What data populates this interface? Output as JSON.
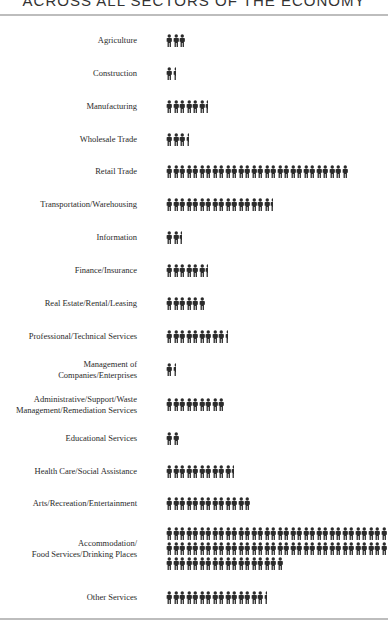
{
  "title": "ACROSS ALL SECTORS OF THE ECONOMY",
  "icon": "person-icon",
  "icon_color": "#2b2b2b",
  "chart_data": {
    "type": "pictograph",
    "title": "ACROSS ALL SECTORS OF THE ECONOMY",
    "unit": "person icons (relative employment)",
    "categories": [
      "Agriculture",
      "Construction",
      "Manufacturing",
      "Wholesale Trade",
      "Retail Trade",
      "Transportation/Warehousing",
      "Information",
      "Finance/Insurance",
      "Real Estate/Rental/Leasing",
      "Professional/Technical Services",
      "Management of Companies/Enterprises",
      "Administrative/Support/Waste Management/Remediation Services",
      "Educational Services",
      "Health Care/Social Assistance",
      "Arts/Recreation/Entertainment",
      "Accommodation/Food Services/Drinking Places",
      "Other Services"
    ],
    "values": [
      3,
      1.5,
      6.5,
      3.5,
      28,
      16.5,
      2.5,
      6.5,
      6,
      9.5,
      1.5,
      9,
      2,
      10.5,
      13,
      86,
      15.5
    ]
  },
  "rows": [
    {
      "label": [
        "Agriculture"
      ],
      "count": 3,
      "y": 34
    },
    {
      "label": [
        "Construction"
      ],
      "count": 1.5,
      "y": 67
    },
    {
      "label": [
        "Manufacturing"
      ],
      "count": 6.5,
      "y": 100
    },
    {
      "label": [
        "Wholesale Trade"
      ],
      "count": 3.5,
      "y": 133
    },
    {
      "label": [
        "Retail Trade"
      ],
      "count": 28,
      "y": 165
    },
    {
      "label": [
        "Transportation/Warehousing"
      ],
      "count": 16.5,
      "y": 198
    },
    {
      "label": [
        "Information"
      ],
      "count": 2.5,
      "y": 231
    },
    {
      "label": [
        "Finance/Insurance"
      ],
      "count": 6.5,
      "y": 264
    },
    {
      "label": [
        "Real Estate/Rental/Leasing"
      ],
      "count": 6,
      "y": 297
    },
    {
      "label": [
        "Professional/Technical Services"
      ],
      "count": 9.5,
      "y": 330
    },
    {
      "label": [
        "Management of",
        "Companies/Enterprises"
      ],
      "count": 1.5,
      "y": 363
    },
    {
      "label": [
        "Administrative/Support/Waste",
        "Management/Remediation Services"
      ],
      "count": 9,
      "y": 398
    },
    {
      "label": [
        "Educational Services"
      ],
      "count": 2,
      "y": 432
    },
    {
      "label": [
        "Health Care/Social Assistance"
      ],
      "count": 10.5,
      "y": 465
    },
    {
      "label": [
        "Arts/Recreation/Entertainment"
      ],
      "count": 13,
      "y": 497
    },
    {
      "label": [
        "Accommodation/",
        "Food Services/Drinking Places"
      ],
      "count": 86,
      "y": 527
    },
    {
      "label": [
        "Other Services"
      ],
      "count": 15.5,
      "y": 591
    }
  ]
}
